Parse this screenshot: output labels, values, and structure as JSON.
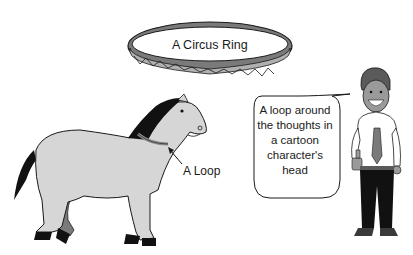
{
  "figures": {
    "circus_ring": {
      "label": "A Circus Ring"
    },
    "horse": {
      "label": "A Loop"
    },
    "cartoon_character": {
      "speech_bubble_text": "A loop around the thoughts in a cartoon character's head"
    }
  },
  "colors": {
    "background": "#ffffff",
    "outline": "#1a1a1a",
    "light_gray": "#d6d6d6",
    "mid_gray": "#8a8a8a",
    "dark_gray": "#5a5a5a",
    "black": "#111111"
  }
}
